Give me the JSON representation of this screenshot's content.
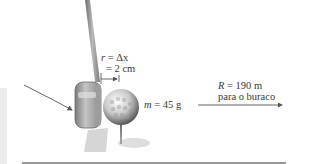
{
  "diagram": {
    "labels": {
      "displacement_line1_var": "r",
      "displacement_line1_rest": " = Δx",
      "displacement_line2": "= 2 cm",
      "mass_var": "m",
      "mass_rest": " = 45 g",
      "range_var": "R",
      "range_rest": " = 190 m",
      "range_line2": "para o buraco"
    },
    "colors": {
      "shaft": "#8c8c8c",
      "club_head": "#a8a8a8",
      "ball": "#d9d9d9",
      "arrow": "#555555",
      "rule": "#9a9a9a"
    }
  }
}
